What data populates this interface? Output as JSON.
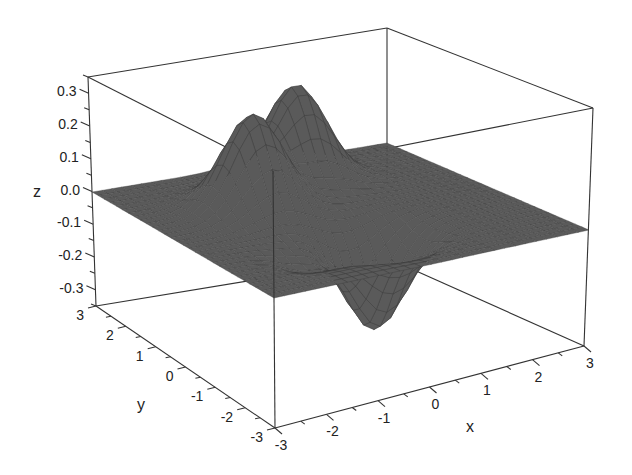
{
  "chart_data": {
    "type": "surface3d",
    "title": "",
    "function_description": "Surface over x,y in [-3,3] with two positive peaks (~0.3) and one negative trough (~-0.3); flat near z=0 elsewhere",
    "xlabel": "x",
    "ylabel": "y",
    "zlabel": "z",
    "xlim": [
      -3,
      3
    ],
    "ylim": [
      -3,
      3
    ],
    "zlim": [
      -0.35,
      0.35
    ],
    "x_ticks": [
      "-3",
      "-2",
      "-1",
      "0",
      "1",
      "2",
      "3"
    ],
    "y_ticks": [
      "3",
      "2",
      "1",
      "0",
      "-1",
      "-2",
      "-3"
    ],
    "z_ticks": [
      "0.3",
      "0.2",
      "0.1",
      "0.0",
      "-0.1",
      "-0.2",
      "-0.3"
    ],
    "grid": false,
    "legend": null,
    "colormap": "gray",
    "features": [
      {
        "type": "peak",
        "x": -1.0,
        "y": 1.0,
        "z": 0.3
      },
      {
        "type": "peak",
        "x": 0.5,
        "y": 2.0,
        "z": 0.3
      },
      {
        "type": "trough",
        "x": 0.0,
        "y": -1.2,
        "z": -0.3
      },
      {
        "type": "small_trough",
        "x": -1.5,
        "y": -1.5,
        "z": -0.05
      }
    ]
  }
}
